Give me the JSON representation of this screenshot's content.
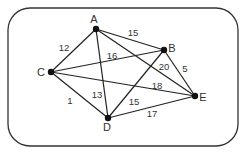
{
  "diagram": {
    "type": "weighted-undirected-graph",
    "frame": {
      "x": 8,
      "y": 8,
      "width": 230,
      "height": 138,
      "radius": 22,
      "stroke": "#333333"
    },
    "colors": {
      "edge": "#222222",
      "node": "#111111",
      "text": "#333333"
    },
    "nodes": [
      {
        "id": "A",
        "label": "A",
        "x": 96,
        "y": 29,
        "lx": 94,
        "ly": 23
      },
      {
        "id": "B",
        "label": "B",
        "x": 164,
        "y": 50,
        "lx": 172,
        "ly": 52
      },
      {
        "id": "C",
        "label": "C",
        "x": 51,
        "y": 72,
        "lx": 41,
        "ly": 76
      },
      {
        "id": "D",
        "label": "D",
        "x": 108,
        "y": 118,
        "lx": 107,
        "ly": 131
      },
      {
        "id": "E",
        "label": "E",
        "x": 195,
        "y": 96,
        "lx": 203,
        "ly": 101
      }
    ],
    "edges": [
      {
        "from": "A",
        "to": "B",
        "weight": "15",
        "lx": 133,
        "ly": 36
      },
      {
        "from": "A",
        "to": "C",
        "weight": "12",
        "lx": 64,
        "ly": 51
      },
      {
        "from": "A",
        "to": "D",
        "weight": "13",
        "lx": 97,
        "ly": 98
      },
      {
        "from": "A",
        "to": "E",
        "weight": "20",
        "lx": 164,
        "ly": 70
      },
      {
        "from": "C",
        "to": "B",
        "weight": "16",
        "lx": 112,
        "ly": 59
      },
      {
        "from": "C",
        "to": "E",
        "weight": "18",
        "lx": 157,
        "ly": 89
      },
      {
        "from": "C",
        "to": "D",
        "weight": "1",
        "lx": 70,
        "ly": 104
      },
      {
        "from": "B",
        "to": "D",
        "weight": "15",
        "lx": 134,
        "ly": 105
      },
      {
        "from": "B",
        "to": "E",
        "weight": "5",
        "lx": 185,
        "ly": 72
      },
      {
        "from": "D",
        "to": "E",
        "weight": "17",
        "lx": 152,
        "ly": 117
      }
    ]
  }
}
